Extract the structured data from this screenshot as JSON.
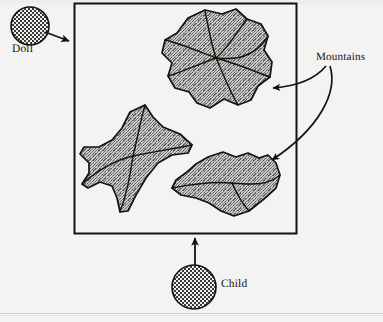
{
  "figure": {
    "type": "labeled-diagram",
    "background_color": "#f3f3f2",
    "ink_color": "#14120f",
    "fill_color": "#9a9a98",
    "canvas": {
      "width": 383,
      "height": 322
    },
    "frame": {
      "name": "sandbox-frame",
      "x": 74,
      "y": 3,
      "width": 223,
      "height": 231,
      "stroke_width": 2
    },
    "labels": {
      "doll": "Doll",
      "child": "Child",
      "mountains": "Mountains"
    },
    "markers": [
      {
        "name": "doll-marker",
        "label": "Doll",
        "shape": "circle",
        "pattern": "checkerboard",
        "cx": 30,
        "cy": 26,
        "r": 19
      },
      {
        "name": "child-marker",
        "label": "Child",
        "shape": "circle",
        "pattern": "checkerboard",
        "cx": 194,
        "cy": 287,
        "r": 22
      }
    ],
    "mountains": [
      {
        "name": "mountain-top",
        "label": "Mountains",
        "center": [
          215,
          63
        ],
        "approx_width": 115,
        "approx_height": 110,
        "ridge_count": 6
      },
      {
        "name": "mountain-left",
        "label": "Mountains",
        "center": [
          136,
          158
        ],
        "approx_width": 105,
        "approx_height": 115,
        "ridge_count": 4
      },
      {
        "name": "mountain-bottom",
        "label": "Mountains",
        "center": [
          225,
          187
        ],
        "approx_width": 110,
        "approx_height": 65,
        "ridge_count": 2
      }
    ],
    "arrows": [
      {
        "name": "arrow-doll-to-frame",
        "from": "doll-marker",
        "to": "sandbox-frame",
        "style": "straight",
        "direction": "right"
      },
      {
        "name": "arrow-child-to-frame",
        "from": "child-marker",
        "to": "sandbox-frame",
        "style": "straight",
        "direction": "up"
      },
      {
        "name": "arrow-mountains-to-top-mountain",
        "from": "mountains-label",
        "to": "mountain-top",
        "style": "curved",
        "direction": "left"
      },
      {
        "name": "arrow-mountains-to-bottom-mountain",
        "from": "mountains-label",
        "to": "mountain-bottom",
        "style": "curved",
        "direction": "down-left"
      }
    ]
  }
}
